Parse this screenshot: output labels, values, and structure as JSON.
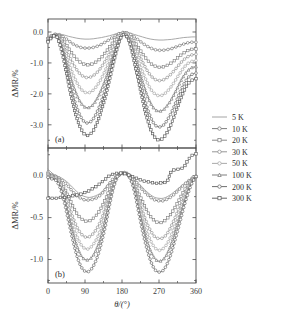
{
  "figure": {
    "xlabel": "θ/(°)",
    "panels": [
      {
        "tag": "(a)",
        "ylabel": "ΔMR/%",
        "yticks": [
          "0.0",
          "-1.0",
          "-2.0",
          "-3.0"
        ]
      },
      {
        "tag": "(b)",
        "ylabel": "ΔMR/%",
        "yticks": [
          "0.0",
          "-0.5",
          "-1.0"
        ]
      }
    ],
    "xticks": [
      "0",
      "90",
      "180",
      "270",
      "360"
    ]
  },
  "legend": {
    "entries": [
      {
        "label": "5 K",
        "marker": "none",
        "color": "#9a9a9a"
      },
      {
        "label": "10 K",
        "marker": "circle",
        "color": "#6f6f6f"
      },
      {
        "label": "20 K",
        "marker": "square",
        "color": "#7d7d7d"
      },
      {
        "label": "30 K",
        "marker": "circle",
        "color": "#8a8a8a"
      },
      {
        "label": "50 K",
        "marker": "circle",
        "color": "#a0a0a0"
      },
      {
        "label": "100 K",
        "marker": "triangle",
        "color": "#707070"
      },
      {
        "label": "200 K",
        "marker": "circle",
        "color": "#5e5e5e"
      },
      {
        "label": "300 K",
        "marker": "square",
        "color": "#555555"
      }
    ]
  },
  "chart_data": {
    "type": "line",
    "title": "",
    "xlabel": "θ/(°)",
    "ylabel": "ΔMR/%",
    "grid": false,
    "legend_position": "right-outside",
    "subplots": [
      {
        "tag": "(a)",
        "xlim": [
          0,
          360
        ],
        "ylim": [
          -3.75,
          0.42
        ],
        "xticks": [
          0,
          90,
          180,
          270,
          360
        ],
        "yticks": [
          0.0,
          -1.0,
          -2.0,
          -3.0
        ],
        "x": [
          0,
          10,
          20,
          30,
          40,
          50,
          60,
          70,
          80,
          90,
          100,
          110,
          120,
          130,
          140,
          150,
          160,
          170,
          180,
          190,
          200,
          210,
          220,
          230,
          240,
          250,
          260,
          270,
          280,
          290,
          300,
          310,
          320,
          330,
          340,
          350,
          360
        ],
        "series": [
          {
            "name": "5 K",
            "values": [
              -0.18,
              -0.1,
              -0.06,
              -0.07,
              -0.1,
              -0.14,
              -0.17,
              -0.2,
              -0.22,
              -0.23,
              -0.23,
              -0.22,
              -0.2,
              -0.18,
              -0.15,
              -0.12,
              -0.08,
              -0.04,
              -0.02,
              -0.02,
              -0.04,
              -0.08,
              -0.12,
              -0.16,
              -0.2,
              -0.23,
              -0.25,
              -0.26,
              -0.26,
              -0.25,
              -0.24,
              -0.22,
              -0.2,
              -0.18,
              -0.17,
              -0.16,
              -0.16
            ]
          },
          {
            "name": "10 K",
            "values": [
              -0.2,
              -0.11,
              -0.07,
              -0.1,
              -0.18,
              -0.28,
              -0.38,
              -0.45,
              -0.5,
              -0.52,
              -0.52,
              -0.5,
              -0.46,
              -0.4,
              -0.32,
              -0.24,
              -0.15,
              -0.07,
              -0.02,
              -0.02,
              -0.07,
              -0.16,
              -0.26,
              -0.36,
              -0.45,
              -0.52,
              -0.57,
              -0.59,
              -0.59,
              -0.57,
              -0.54,
              -0.49,
              -0.44,
              -0.39,
              -0.35,
              -0.33,
              -0.33
            ]
          },
          {
            "name": "20 K",
            "values": [
              -0.22,
              -0.12,
              -0.08,
              -0.16,
              -0.32,
              -0.52,
              -0.72,
              -0.88,
              -0.99,
              -1.05,
              -1.06,
              -1.02,
              -0.94,
              -0.82,
              -0.66,
              -0.48,
              -0.3,
              -0.13,
              -0.03,
              -0.03,
              -0.13,
              -0.3,
              -0.5,
              -0.7,
              -0.88,
              -1.02,
              -1.1,
              -1.14,
              -1.13,
              -1.08,
              -1.0,
              -0.9,
              -0.78,
              -0.68,
              -0.6,
              -0.56,
              -0.55
            ]
          },
          {
            "name": "30 K",
            "values": [
              -0.24,
              -0.13,
              -0.09,
              -0.22,
              -0.46,
              -0.74,
              -1.0,
              -1.22,
              -1.38,
              -1.46,
              -1.47,
              -1.41,
              -1.3,
              -1.13,
              -0.92,
              -0.68,
              -0.42,
              -0.19,
              -0.05,
              -0.05,
              -0.18,
              -0.42,
              -0.7,
              -0.97,
              -1.22,
              -1.41,
              -1.53,
              -1.57,
              -1.55,
              -1.47,
              -1.35,
              -1.2,
              -1.04,
              -0.9,
              -0.8,
              -0.74,
              -0.72
            ]
          },
          {
            "name": "50 K",
            "values": [
              -0.26,
              -0.14,
              -0.1,
              -0.28,
              -0.6,
              -0.98,
              -1.34,
              -1.63,
              -1.84,
              -1.95,
              -1.96,
              -1.88,
              -1.72,
              -1.5,
              -1.22,
              -0.9,
              -0.56,
              -0.26,
              -0.07,
              -0.07,
              -0.24,
              -0.56,
              -0.92,
              -1.28,
              -1.6,
              -1.85,
              -2.0,
              -2.06,
              -2.03,
              -1.92,
              -1.76,
              -1.56,
              -1.35,
              -1.16,
              -1.02,
              -0.95,
              -0.92
            ]
          },
          {
            "name": "100 K",
            "values": [
              -0.28,
              -0.15,
              -0.11,
              -0.34,
              -0.74,
              -1.22,
              -1.67,
              -2.03,
              -2.29,
              -2.43,
              -2.44,
              -2.34,
              -2.14,
              -1.86,
              -1.52,
              -1.12,
              -0.7,
              -0.33,
              -0.09,
              -0.09,
              -0.3,
              -0.7,
              -1.15,
              -1.6,
              -2.0,
              -2.31,
              -2.5,
              -2.56,
              -2.52,
              -2.38,
              -2.18,
              -1.93,
              -1.66,
              -1.42,
              -1.25,
              -1.15,
              -1.12
            ]
          },
          {
            "name": "200 K",
            "values": [
              -0.3,
              -0.16,
              -0.12,
              -0.4,
              -0.88,
              -1.46,
              -2.0,
              -2.44,
              -2.75,
              -2.92,
              -2.93,
              -2.81,
              -2.57,
              -2.23,
              -1.82,
              -1.34,
              -0.84,
              -0.4,
              -0.11,
              -0.11,
              -0.36,
              -0.84,
              -1.38,
              -1.92,
              -2.4,
              -2.77,
              -3.0,
              -3.07,
              -3.02,
              -2.85,
              -2.61,
              -2.31,
              -1.98,
              -1.7,
              -1.49,
              -1.37,
              -1.33
            ]
          },
          {
            "name": "300 K",
            "values": [
              -0.32,
              -0.17,
              -0.13,
              -0.45,
              -1.0,
              -1.66,
              -2.27,
              -2.77,
              -3.12,
              -3.32,
              -3.33,
              -3.19,
              -2.92,
              -2.53,
              -2.07,
              -1.52,
              -0.96,
              -0.45,
              -0.12,
              -0.12,
              -0.41,
              -0.96,
              -1.57,
              -2.18,
              -2.73,
              -3.15,
              -3.41,
              -3.49,
              -3.43,
              -3.24,
              -2.97,
              -2.62,
              -2.25,
              -1.93,
              -1.69,
              -1.56,
              -1.51
            ]
          }
        ]
      },
      {
        "tag": "(b)",
        "xlim": [
          0,
          360
        ],
        "ylim": [
          -1.28,
          0.33
        ],
        "xticks": [
          0,
          90,
          180,
          270,
          360
        ],
        "yticks": [
          0.0,
          -0.5,
          -1.0
        ],
        "x": [
          0,
          10,
          20,
          30,
          40,
          50,
          60,
          70,
          80,
          90,
          100,
          110,
          120,
          130,
          140,
          150,
          160,
          170,
          180,
          190,
          200,
          210,
          220,
          230,
          240,
          250,
          260,
          270,
          280,
          290,
          300,
          310,
          320,
          330,
          340,
          350,
          360
        ],
        "series": [
          {
            "name": "5 K",
            "values": [
              0.08,
              0.03,
              0.0,
              -0.02,
              -0.05,
              -0.09,
              -0.14,
              -0.19,
              -0.23,
              -0.25,
              -0.26,
              -0.25,
              -0.23,
              -0.2,
              -0.14,
              -0.08,
              -0.03,
              0.0,
              0.02,
              0.02,
              0.0,
              -0.04,
              -0.09,
              -0.14,
              -0.19,
              -0.23,
              -0.26,
              -0.27,
              -0.27,
              -0.25,
              -0.22,
              -0.18,
              -0.14,
              -0.1,
              -0.06,
              -0.03,
              -0.01
            ]
          },
          {
            "name": "10 K",
            "values": [
              0.04,
              0.01,
              -0.01,
              -0.04,
              -0.08,
              -0.13,
              -0.19,
              -0.24,
              -0.27,
              -0.29,
              -0.29,
              -0.28,
              -0.26,
              -0.22,
              -0.16,
              -0.09,
              -0.03,
              0.0,
              0.02,
              0.02,
              0.0,
              -0.05,
              -0.11,
              -0.17,
              -0.22,
              -0.26,
              -0.29,
              -0.3,
              -0.3,
              -0.28,
              -0.25,
              -0.21,
              -0.16,
              -0.11,
              -0.07,
              -0.03,
              -0.01
            ]
          },
          {
            "name": "20 K",
            "values": [
              0.02,
              0.0,
              -0.02,
              -0.07,
              -0.15,
              -0.25,
              -0.36,
              -0.45,
              -0.51,
              -0.54,
              -0.54,
              -0.51,
              -0.46,
              -0.38,
              -0.28,
              -0.16,
              -0.06,
              0.0,
              0.03,
              0.03,
              -0.01,
              -0.09,
              -0.2,
              -0.31,
              -0.41,
              -0.49,
              -0.54,
              -0.56,
              -0.55,
              -0.51,
              -0.45,
              -0.37,
              -0.28,
              -0.19,
              -0.11,
              -0.05,
              -0.01
            ]
          },
          {
            "name": "30 K",
            "values": [
              0.01,
              -0.01,
              -0.03,
              -0.09,
              -0.2,
              -0.34,
              -0.49,
              -0.61,
              -0.69,
              -0.73,
              -0.73,
              -0.69,
              -0.62,
              -0.52,
              -0.38,
              -0.22,
              -0.08,
              0.0,
              0.03,
              0.03,
              -0.02,
              -0.12,
              -0.27,
              -0.42,
              -0.56,
              -0.66,
              -0.73,
              -0.75,
              -0.74,
              -0.69,
              -0.6,
              -0.49,
              -0.37,
              -0.25,
              -0.15,
              -0.06,
              -0.01
            ]
          },
          {
            "name": "50 K",
            "values": [
              0.0,
              -0.02,
              -0.04,
              -0.11,
              -0.24,
              -0.41,
              -0.58,
              -0.72,
              -0.82,
              -0.87,
              -0.87,
              -0.82,
              -0.74,
              -0.61,
              -0.45,
              -0.26,
              -0.1,
              0.0,
              0.03,
              0.03,
              -0.02,
              -0.14,
              -0.32,
              -0.5,
              -0.66,
              -0.78,
              -0.86,
              -0.89,
              -0.87,
              -0.81,
              -0.71,
              -0.58,
              -0.44,
              -0.3,
              -0.17,
              -0.07,
              -0.01
            ]
          },
          {
            "name": "100 K",
            "values": [
              -0.01,
              -0.03,
              -0.05,
              -0.13,
              -0.28,
              -0.47,
              -0.67,
              -0.83,
              -0.95,
              -1.0,
              -1.0,
              -0.95,
              -0.85,
              -0.71,
              -0.52,
              -0.3,
              -0.11,
              0.0,
              0.03,
              0.03,
              -0.03,
              -0.16,
              -0.37,
              -0.58,
              -0.76,
              -0.9,
              -0.99,
              -1.02,
              -1.0,
              -0.93,
              -0.81,
              -0.66,
              -0.5,
              -0.34,
              -0.19,
              -0.08,
              -0.01
            ]
          },
          {
            "name": "200 K",
            "values": [
              -0.02,
              -0.04,
              -0.06,
              -0.15,
              -0.32,
              -0.54,
              -0.76,
              -0.95,
              -1.08,
              -1.14,
              -1.14,
              -1.08,
              -0.97,
              -0.8,
              -0.59,
              -0.34,
              -0.13,
              0.0,
              0.03,
              0.03,
              -0.03,
              -0.18,
              -0.42,
              -0.66,
              -0.86,
              -1.02,
              -1.12,
              -1.15,
              -1.13,
              -1.05,
              -0.92,
              -0.75,
              -0.57,
              -0.38,
              -0.22,
              -0.09,
              -0.01
            ]
          },
          {
            "name": "300 K",
            "values": [
              -0.27,
              -0.27,
              -0.27,
              -0.26,
              -0.26,
              -0.25,
              -0.24,
              -0.23,
              -0.22,
              -0.2,
              -0.18,
              -0.15,
              -0.12,
              -0.08,
              -0.04,
              0.0,
              0.02,
              0.03,
              0.03,
              0.02,
              0.0,
              -0.02,
              -0.04,
              -0.06,
              -0.07,
              -0.08,
              -0.09,
              -0.09,
              -0.08,
              -0.07,
              0.05,
              0.07,
              0.08,
              0.1,
              0.18,
              0.24,
              0.26
            ]
          }
        ]
      }
    ]
  }
}
